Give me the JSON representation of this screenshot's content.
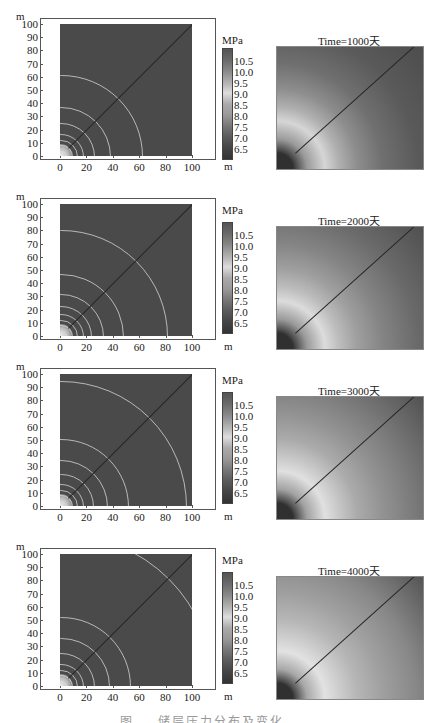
{
  "figure": {
    "caption": "图 … 储层压力分布及变化",
    "panels": [
      {
        "time_label": "Time=1000天",
        "contour_radii_m": [
          4,
          8,
          12,
          17,
          25,
          37,
          61
        ],
        "map_rings": [
          "#303030",
          "#4a4a4a",
          "#9a9a9a",
          "#d6d6d6",
          "#b0b0b0",
          "#8e8e8e",
          "#707070",
          "#5a5a5a"
        ]
      },
      {
        "time_label": "Time=2000天",
        "contour_radii_m": [
          4,
          8,
          12,
          17,
          23,
          32,
          47,
          80
        ],
        "map_rings": [
          "#303030",
          "#4a4a4a",
          "#9a9a9a",
          "#dcdcdc",
          "#bdbdbd",
          "#a0a0a0",
          "#858585",
          "#6a6a6a"
        ]
      },
      {
        "time_label": "Time=3000天",
        "contour_radii_m": [
          4,
          8,
          12,
          17,
          24,
          35,
          51,
          95
        ],
        "map_rings": [
          "#303030",
          "#4c4c4c",
          "#a2a2a2",
          "#e0e0e0",
          "#c8c8c8",
          "#ababab",
          "#939393",
          "#787878"
        ]
      },
      {
        "time_label": "Time=4000天",
        "contour_radii_m": [
          4,
          8,
          12,
          17,
          25,
          36,
          52,
          115
        ],
        "map_rings": [
          "#303030",
          "#4e4e4e",
          "#a8a8a8",
          "#e2e2e2",
          "#cecece",
          "#b6b6b6",
          "#a0a0a0",
          "#878787"
        ]
      }
    ],
    "axes": {
      "x_unit": "m",
      "y_unit": "m",
      "x_ticks": [
        "0",
        "20",
        "40",
        "60",
        "80",
        "100"
      ],
      "y_ticks": [
        "100",
        "90",
        "80",
        "70",
        "60",
        "50",
        "40",
        "30",
        "20",
        "10",
        "0"
      ]
    },
    "colorbar": {
      "unit": "MPa",
      "ticks": [
        "10.5",
        "10.0",
        "9.5",
        "9.0",
        "8.5",
        "8.0",
        "7.5",
        "7.0",
        "6.5"
      ]
    }
  },
  "chart_data": [
    {
      "type": "heatmap",
      "title": "Pressure contour (left) / Time=1000天 (right)",
      "xlabel": "m",
      "ylabel": "m",
      "xlim": [
        0,
        100
      ],
      "ylim": [
        0,
        100
      ],
      "colorbar": {
        "label": "MPa",
        "ticks": [
          6.5,
          7.0,
          7.5,
          8.0,
          8.5,
          9.0,
          9.5,
          10.0,
          10.5
        ]
      },
      "contour_radii_approx_m": [
        4,
        8,
        12,
        17,
        25,
        37,
        61
      ]
    },
    {
      "type": "heatmap",
      "title": "Time=2000天",
      "xlabel": "m",
      "ylabel": "m",
      "xlim": [
        0,
        100
      ],
      "ylim": [
        0,
        100
      ],
      "colorbar": {
        "label": "MPa",
        "ticks": [
          6.5,
          7.0,
          7.5,
          8.0,
          8.5,
          9.0,
          9.5,
          10.0,
          10.5
        ]
      },
      "contour_radii_approx_m": [
        4,
        8,
        12,
        17,
        23,
        32,
        47,
        80
      ]
    },
    {
      "type": "heatmap",
      "title": "Time=3000天",
      "xlabel": "m",
      "ylabel": "m",
      "xlim": [
        0,
        100
      ],
      "ylim": [
        0,
        100
      ],
      "colorbar": {
        "label": "MPa",
        "ticks": [
          6.5,
          7.0,
          7.5,
          8.0,
          8.5,
          9.0,
          9.5,
          10.0,
          10.5
        ]
      },
      "contour_radii_approx_m": [
        4,
        8,
        12,
        17,
        24,
        35,
        51,
        95
      ]
    },
    {
      "type": "heatmap",
      "title": "Time=4000天",
      "xlabel": "m",
      "ylabel": "m",
      "xlim": [
        0,
        100
      ],
      "ylim": [
        0,
        100
      ],
      "colorbar": {
        "label": "MPa",
        "ticks": [
          6.5,
          7.0,
          7.5,
          8.0,
          8.5,
          9.0,
          9.5,
          10.0,
          10.5
        ]
      },
      "contour_radii_approx_m": [
        4,
        8,
        12,
        17,
        25,
        36,
        52,
        115
      ]
    }
  ]
}
